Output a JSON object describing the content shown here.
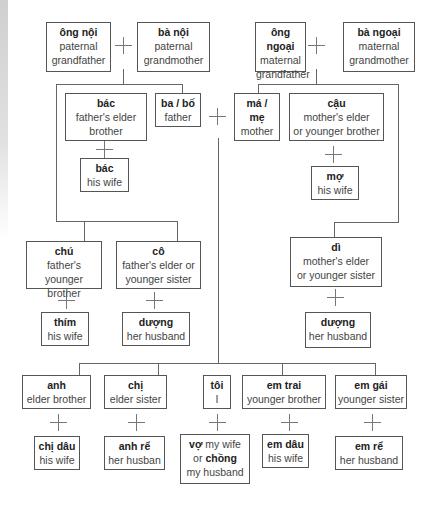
{
  "diagram": {
    "type": "family-tree",
    "nodes": {
      "ong_noi": {
        "term": "ông nội",
        "gloss": [
          "paternal",
          "grandfather"
        ]
      },
      "ba_noi": {
        "term": "bà nội",
        "gloss": [
          "paternal",
          "grandmother"
        ]
      },
      "ong_ngoai": {
        "term": "ông ngoại",
        "gloss": [
          "maternal",
          "grandfather"
        ]
      },
      "ba_ngoai": {
        "term": "bà ngoại",
        "gloss": [
          "maternal",
          "grandmother"
        ]
      },
      "bac": {
        "term": "bác",
        "gloss": [
          "father's elder",
          "brother"
        ]
      },
      "bac_wife": {
        "term": "bác",
        "gloss": [
          "his wife"
        ]
      },
      "ba_bo": {
        "term": "ba / bố",
        "gloss": [
          "father"
        ]
      },
      "ma_me": {
        "term": [
          "má /",
          "mẹ"
        ],
        "gloss": [
          "mother"
        ]
      },
      "cau": {
        "term": "cậu",
        "gloss": [
          "mother's elder",
          "or younger brother"
        ]
      },
      "mo": {
        "term": "mợ",
        "gloss": [
          "his wife"
        ]
      },
      "chu": {
        "term": "chú",
        "gloss": [
          "father's younger",
          "brother"
        ]
      },
      "thim": {
        "term": "thím",
        "gloss": [
          "his wife"
        ]
      },
      "co": {
        "term": "cô",
        "gloss": [
          "father's elder or",
          "younger sister"
        ]
      },
      "duong_co": {
        "term": "dượng",
        "gloss": [
          "her husband"
        ]
      },
      "di": {
        "term": "dì",
        "gloss": [
          "mother's elder",
          "or younger sister"
        ]
      },
      "duong_di": {
        "term": "dượng",
        "gloss": [
          "her husband"
        ]
      },
      "anh": {
        "term": "anh",
        "gloss": [
          "elder brother"
        ]
      },
      "chi_dau": {
        "term": "chị dâu",
        "gloss": [
          "his wife"
        ]
      },
      "chi": {
        "term": "chị",
        "gloss": [
          "elder sister"
        ]
      },
      "anh_re": {
        "term": "anh rể",
        "gloss": [
          "her husban"
        ]
      },
      "toi": {
        "term": "tôi",
        "gloss": [
          "I"
        ]
      },
      "spouse": {
        "term1": "vợ",
        "gloss1": " my wife",
        "mid": "or ",
        "term2": "chồng",
        "gloss2": "my husband"
      },
      "em_trai": {
        "term": "em trai",
        "gloss": [
          "younger brother"
        ]
      },
      "em_dau": {
        "term": "em dâu",
        "gloss": [
          "his wife"
        ]
      },
      "em_gai": {
        "term": "em gái",
        "gloss": [
          "younger sister"
        ]
      },
      "em_re": {
        "term": "em rể",
        "gloss": [
          "her husband"
        ]
      }
    },
    "marriage_symbol": "+",
    "colors": {
      "border": "#555555",
      "line": "#666666",
      "text": "#444444",
      "bold_text": "#222222"
    }
  }
}
